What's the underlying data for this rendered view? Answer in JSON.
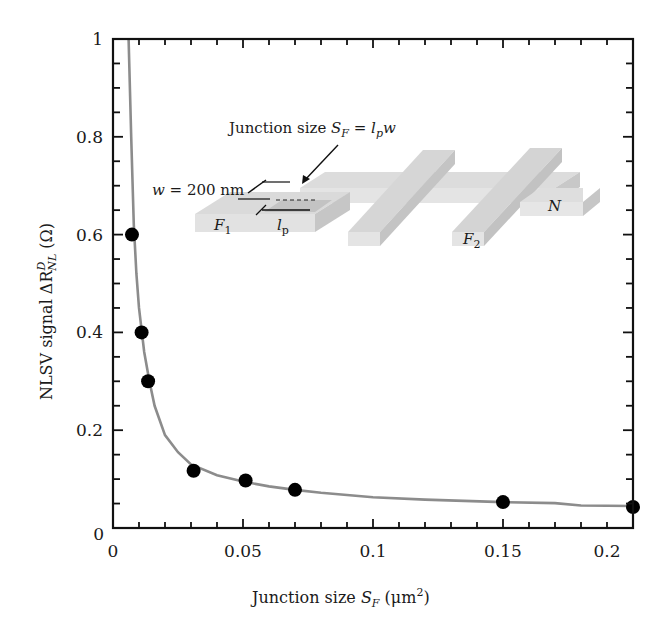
{
  "chart_data": {
    "type": "scatter",
    "title": "",
    "xlabel": "Junction size S_F (μm²)",
    "ylabel": "NLSV signal ΔR^D_NL (Ω)",
    "xlim": [
      0,
      0.2
    ],
    "ylim": [
      0,
      1
    ],
    "x_ticks": [
      0,
      0.05,
      0.1,
      0.15,
      0.2
    ],
    "x_tick_labels": [
      "0",
      "0.05",
      "0.1",
      "0.15",
      "0.2"
    ],
    "y_ticks": [
      0,
      0.2,
      0.4,
      0.6,
      0.8,
      1
    ],
    "y_tick_labels": [
      "0",
      "0.2",
      "0.4",
      "0.6",
      "0.8",
      "1"
    ],
    "grid": false,
    "legend": null,
    "series": [
      {
        "name": "Measured data",
        "style": "markers",
        "color": "#000000",
        "x": [
          0.0073,
          0.011,
          0.0135,
          0.031,
          0.051,
          0.07,
          0.15,
          0.2
        ],
        "y": [
          0.6,
          0.4,
          0.3,
          0.117,
          0.097,
          0.078,
          0.053,
          0.043
        ]
      },
      {
        "name": "Fit curve",
        "style": "line",
        "color": "#8c8c8c",
        "x": [
          0.006,
          0.007,
          0.008,
          0.009,
          0.01,
          0.012,
          0.014,
          0.016,
          0.02,
          0.025,
          0.03,
          0.04,
          0.05,
          0.06,
          0.07,
          0.08,
          0.1,
          0.12,
          0.15,
          0.17,
          0.18,
          0.2
        ],
        "y": [
          1.0,
          0.8,
          0.62,
          0.52,
          0.45,
          0.36,
          0.3,
          0.25,
          0.19,
          0.155,
          0.13,
          0.108,
          0.095,
          0.085,
          0.078,
          0.072,
          0.063,
          0.058,
          0.053,
          0.051,
          0.046,
          0.045
        ]
      }
    ],
    "inset": {
      "description": "Schematic of nonlocal spin valve device",
      "annotation": "Junction size S_F = l_p w",
      "width_label": "w = 200 nm",
      "length_label": "l_p",
      "labels": [
        "F1",
        "F2",
        "N"
      ]
    }
  },
  "axes": {
    "xlabel_main": "Junction size ",
    "xlabel_sym": "S",
    "xlabel_sub": "F",
    "xlabel_unit": " (μm",
    "xlabel_sup": "2",
    "xlabel_close": ")",
    "ylabel_main": "NLSV signal ΔR",
    "ylabel_sup": "D",
    "ylabel_sub": "NL",
    "ylabel_unit": " (Ω)"
  },
  "inset_text": {
    "annotation_main": "Junction size ",
    "annotation_S": "S",
    "annotation_F": "F",
    "annotation_eq": " = ",
    "annotation_l": "l",
    "annotation_p": "p",
    "annotation_w": "w",
    "width_w": "w",
    "width_rest": " = 200 nm",
    "F1_F": "F",
    "F1_sub": "1",
    "F2_F": "F",
    "F2_sub": "2",
    "N": "N",
    "lp_l": "l",
    "lp_p": "p"
  }
}
